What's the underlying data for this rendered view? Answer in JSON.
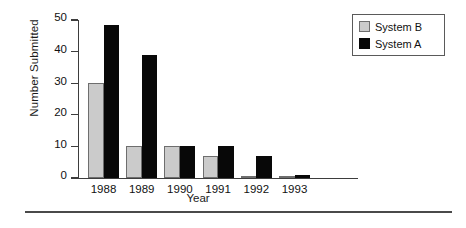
{
  "chart_data": {
    "type": "bar",
    "title": "",
    "xlabel": "Year",
    "ylabel": "Number Submitted",
    "categories": [
      "1988",
      "1989",
      "1990",
      "1991",
      "1992",
      "1993"
    ],
    "series": [
      {
        "name": "System B",
        "color": "#cbcbcb",
        "values": [
          30,
          10,
          10,
          7,
          0.3,
          0.3
        ]
      },
      {
        "name": "System A",
        "color": "#080808",
        "values": [
          48.5,
          39,
          10,
          10,
          7,
          1
        ]
      }
    ],
    "ylim": [
      0,
      50
    ],
    "yticks": [
      0,
      10,
      20,
      30,
      40,
      50
    ],
    "yticklabels": [
      "0",
      "10",
      "20",
      "30",
      "40",
      "50"
    ],
    "grid": false,
    "legend_position": "top-right",
    "legend_entries": [
      "System B",
      "System A"
    ]
  },
  "figure": {
    "bottom_rule": true,
    "background_color": "#ffffff",
    "axis_color": "#3d3d3d"
  }
}
